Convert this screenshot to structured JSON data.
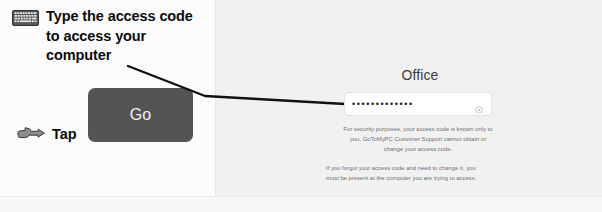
{
  "annotations": {
    "keyboard_icon": "keyboard-icon",
    "hand_icon": "pointing-hand-icon",
    "instruction_lines": [
      "Type the access code",
      "to access your",
      "computer"
    ],
    "tap_label": "Tap"
  },
  "go_button": {
    "label": "Go",
    "background_color": "#545454",
    "text_color": "#f2f2f2"
  },
  "panel": {
    "title": "Office",
    "access_code_field": {
      "masked_value": "•••••••••••••",
      "dot_count": 13,
      "clear_icon": "clear-circle-icon"
    },
    "help_text_1": [
      "For security purposes, your access code is known only to",
      "you. GoToMyPC Customer Support cannot obtain or",
      "change your access code."
    ],
    "help_text_2": [
      "If you forgot your access code and need to change it, you",
      "must be present at the computer you are trying to access."
    ]
  },
  "colors": {
    "panel_background": "#f1f1f1",
    "left_background": "#fcfcfc",
    "annotation_text": "#0b0b0b",
    "help_text": "#6f6f6f",
    "title_text": "#3d3d3d",
    "pointer_line": "#111111"
  }
}
